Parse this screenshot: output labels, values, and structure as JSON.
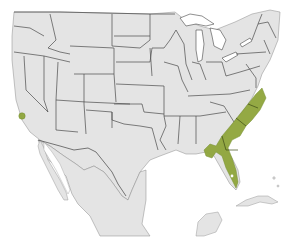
{
  "map": {
    "region": "United States, northern Mexico and Caribbean",
    "colors": {
      "land": "#e4e4e4",
      "water": "#ffffff",
      "state_border": "#4a4a4a",
      "range_highlight": "#8fa53b"
    },
    "highlighted_range": {
      "areas": [
        "Southeastern US coastal plain (Virginia to Florida, Gulf coast to Louisiana)",
        "Southern California coastal spot"
      ]
    }
  }
}
